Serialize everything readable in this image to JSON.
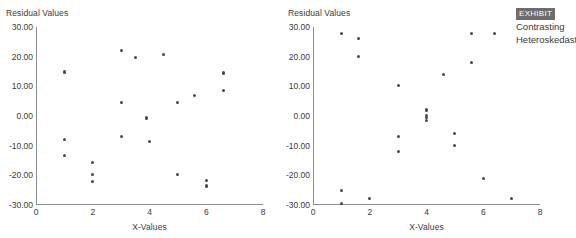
{
  "exhibit": {
    "badge_label": "EXHIBIT",
    "caption_line1": "Contrasting",
    "caption_line2": "Heteroskedasticity"
  },
  "charts": [
    {
      "id": "left",
      "ylabel": "Residual Values",
      "xlabel": "X-Values"
    },
    {
      "id": "right",
      "ylabel": "Residual Values",
      "xlabel": "X-Values"
    }
  ],
  "chart_data": [
    {
      "type": "scatter",
      "title": "",
      "xlabel": "X-Values",
      "ylabel": "Residual Values",
      "xlim": [
        0,
        8
      ],
      "ylim": [
        -30,
        30
      ],
      "xticks": [
        0,
        2,
        4,
        6,
        8
      ],
      "xtick_labels": [
        "0",
        "2",
        "4",
        "6",
        "8"
      ],
      "yticks": [
        30,
        20,
        10,
        0,
        -10,
        -20,
        -30
      ],
      "ytick_labels": [
        "30.00",
        "20.00",
        "10.00",
        "0.00",
        "-10.00",
        "-20.00",
        "-30.00"
      ],
      "grid": false,
      "legend": "none",
      "marker_color": "#4a4a4a",
      "points": [
        {
          "x": 1.0,
          "y": 14.8
        },
        {
          "x": 1.0,
          "y": -7.8
        },
        {
          "x": 1.0,
          "y": -13.2
        },
        {
          "x": 2.0,
          "y": -15.8
        },
        {
          "x": 2.0,
          "y": -19.6
        },
        {
          "x": 2.0,
          "y": -22.0
        },
        {
          "x": 3.0,
          "y": 22.2
        },
        {
          "x": 3.0,
          "y": 4.5
        },
        {
          "x": 3.0,
          "y": -6.9
        },
        {
          "x": 3.5,
          "y": 19.6
        },
        {
          "x": 3.9,
          "y": -0.7
        },
        {
          "x": 4.0,
          "y": -8.7
        },
        {
          "x": 4.5,
          "y": 20.6
        },
        {
          "x": 5.0,
          "y": 4.6
        },
        {
          "x": 5.0,
          "y": -19.7
        },
        {
          "x": 5.6,
          "y": 6.8
        },
        {
          "x": 6.0,
          "y": -21.7
        },
        {
          "x": 6.0,
          "y": -23.6
        },
        {
          "x": 6.6,
          "y": 14.5
        },
        {
          "x": 6.6,
          "y": 8.7
        }
      ]
    },
    {
      "type": "scatter",
      "title": "",
      "xlabel": "X-Values",
      "ylabel": "Residual Values",
      "xlim": [
        0,
        8
      ],
      "ylim": [
        -30,
        30
      ],
      "xticks": [
        0,
        2,
        4,
        6,
        8
      ],
      "xtick_labels": [
        "0",
        "2",
        "4",
        "6",
        "8"
      ],
      "yticks": [
        30,
        20,
        10,
        0,
        -10,
        -20,
        -30
      ],
      "ytick_labels": [
        "30.00",
        "20.00",
        "10.00",
        "0.00",
        "-10.00",
        "-20.00",
        "-30.00"
      ],
      "grid": false,
      "legend": "none",
      "marker_color": "#4a4a4a",
      "points": [
        {
          "x": 1.0,
          "y": 27.8
        },
        {
          "x": 1.0,
          "y": -25.0
        },
        {
          "x": 1.0,
          "y": -29.6
        },
        {
          "x": 1.6,
          "y": 26.1
        },
        {
          "x": 1.6,
          "y": 20.0
        },
        {
          "x": 2.0,
          "y": -27.8
        },
        {
          "x": 3.0,
          "y": 10.3
        },
        {
          "x": 3.0,
          "y": -7.0
        },
        {
          "x": 3.0,
          "y": -12.0
        },
        {
          "x": 4.0,
          "y": 2.0
        },
        {
          "x": 4.0,
          "y": 0.2
        },
        {
          "x": 4.0,
          "y": -0.6
        },
        {
          "x": 4.0,
          "y": -1.4
        },
        {
          "x": 4.6,
          "y": 14.0
        },
        {
          "x": 5.0,
          "y": -5.8
        },
        {
          "x": 5.0,
          "y": -10.0
        },
        {
          "x": 5.6,
          "y": 27.8
        },
        {
          "x": 5.6,
          "y": 17.9
        },
        {
          "x": 6.0,
          "y": -21.0
        },
        {
          "x": 6.4,
          "y": 27.8
        },
        {
          "x": 7.0,
          "y": -27.7
        }
      ]
    }
  ]
}
